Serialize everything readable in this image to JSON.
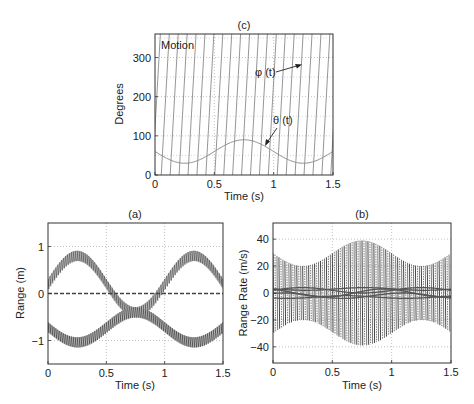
{
  "chart_data": [
    {
      "id": "c",
      "type": "line",
      "title": "(c)",
      "xlabel": "Time (s)",
      "ylabel": "Degrees",
      "xlim": [
        0,
        1.5
      ],
      "ylim": [
        0,
        360
      ],
      "xticks": [
        0,
        0.5,
        1,
        1.5
      ],
      "xtick_labels": [
        "0",
        "0.5",
        "1",
        "1.5"
      ],
      "yticks": [
        0,
        100,
        200,
        300
      ],
      "ytick_labels": [
        "0",
        "100",
        "200",
        "300"
      ],
      "grid": true,
      "annotations": [
        {
          "text": "Motion",
          "x": 0.02,
          "y": 335
        },
        {
          "text": "φ (t)",
          "x": 0.87,
          "y": 282,
          "arrow_to": [
            1.22,
            298
          ]
        },
        {
          "text": "θ (t)",
          "x": 0.98,
          "y": 138,
          "arrow_to": [
            0.93,
            88
          ]
        }
      ],
      "series": [
        {
          "name": "φ (t)",
          "kind": "sawtooth",
          "min": 0,
          "max": 360,
          "cycles_per_s": 13.3,
          "color": "#8a8a8a"
        },
        {
          "name": "θ (t)",
          "kind": "sinusoid",
          "mean": 60,
          "amplitude": 30,
          "period_s": 1.0,
          "min_at_s": 0.25,
          "color": "#8a8a8a"
        }
      ]
    },
    {
      "id": "a",
      "type": "line",
      "title": "(a)",
      "xlabel": "Time (s)",
      "ylabel": "Range (m)",
      "xlim": [
        0,
        1.5
      ],
      "ylim": [
        -1.5,
        1.5
      ],
      "xticks": [
        0,
        0.5,
        1,
        1.5
      ],
      "xtick_labels": [
        "0",
        "0.5",
        "1",
        "1.5"
      ],
      "yticks": [
        -1,
        0,
        1
      ],
      "ytick_labels": [
        "−1",
        "0",
        "1"
      ],
      "grid": true,
      "series": [
        {
          "name": "upper band",
          "kind": "sinusoid_band",
          "mean": 0.2,
          "amplitude": 0.6,
          "period_s": 1.0,
          "max_at_s": 0.25,
          "band_width": 0.22,
          "color": "#666666"
        },
        {
          "name": "lower band",
          "kind": "sinusoid_band",
          "mean": -0.72,
          "amplitude": 0.32,
          "period_s": 1.0,
          "max_at_s": 0.75,
          "band_width": 0.22,
          "color": "#555555"
        },
        {
          "name": "zero line",
          "kind": "constant",
          "value": 0.0,
          "dashed": true,
          "color": "#444444"
        }
      ]
    },
    {
      "id": "b",
      "type": "line",
      "title": "(b)",
      "xlabel": "Time (s)",
      "ylabel": "Range Rate (m/s)",
      "xlim": [
        0,
        1.5
      ],
      "ylim": [
        -52,
        52
      ],
      "xticks": [
        0,
        0.5,
        1,
        1.5
      ],
      "xtick_labels": [
        "0",
        "0.5",
        "1",
        "1.5"
      ],
      "yticks": [
        -40,
        -20,
        0,
        20,
        40
      ],
      "ytick_labels": [
        "−40",
        "−20",
        "0",
        "20",
        "40"
      ],
      "grid": true,
      "series": [
        {
          "name": "oscillation envelope",
          "kind": "oscillating_envelope",
          "env_min": 20,
          "env_max": 39,
          "env_max_at_s": [
            0.62,
            0.88
          ],
          "env_min_at_s": [
            0.25,
            1.25
          ],
          "edge_value": 36,
          "color": "#6a6a6a"
        },
        {
          "name": "low-rate traces",
          "kind": "sinusoid_set",
          "values_range": [
            -4,
            4
          ],
          "color": "#555555"
        }
      ]
    }
  ]
}
